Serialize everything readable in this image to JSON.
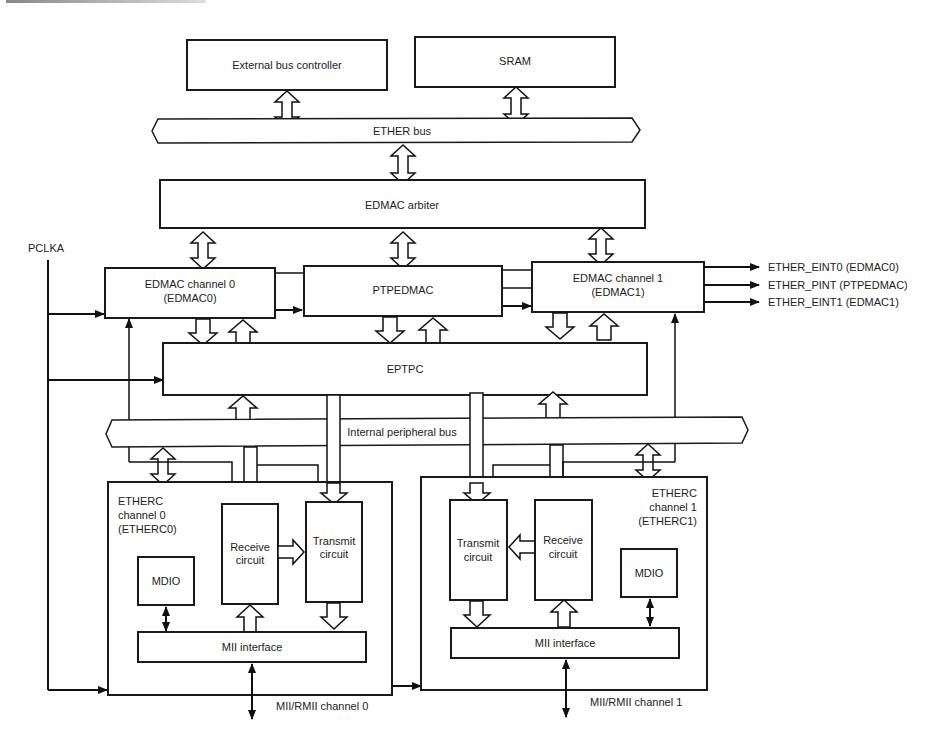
{
  "diagram": {
    "blocks": {
      "ext_bus": "External bus controller",
      "sram": "SRAM",
      "ether_bus": "ETHER bus",
      "arbiter": "EDMAC arbiter",
      "edmac0_l1": "EDMAC channel 0",
      "edmac0_l2": "(EDMAC0)",
      "ptpedmac": "PTPEDMAC",
      "edmac1_l1": "EDMAC channel 1",
      "edmac1_l2": "(EDMAC1)",
      "eptpc": "EPTPC",
      "int_bus": "Internal peripheral bus",
      "etherc0_l1": "ETHERC",
      "etherc0_l2": "channel 0",
      "etherc0_l3": "(ETHERC0)",
      "etherc1_l1": "ETHERC",
      "etherc1_l2": "channel 1",
      "etherc1_l3": "(ETHERC1)",
      "rx_l1": "Receive",
      "rx_l2": "circuit",
      "tx_l1": "Transmit",
      "tx_l2": "circuit",
      "mdio": "MDIO",
      "mii": "MII interface"
    },
    "signals": {
      "pclka": "PCLKA",
      "eint0": "ETHER_EINT0 (EDMAC0)",
      "pint": "ETHER_PINT (PTPEDMAC)",
      "eint1": "ETHER_EINT1 (EDMAC1)",
      "rmii0": "MII/RMII channel 0",
      "rmii1": "MII/RMII channel 1"
    }
  }
}
